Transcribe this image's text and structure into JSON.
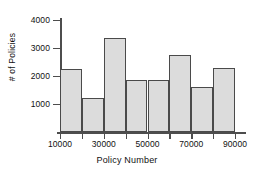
{
  "chart_data": {
    "type": "bar",
    "title": "",
    "xlabel": "Policy Number",
    "ylabel": "# of Policies",
    "categories": [
      "10000-20000",
      "20000-30000",
      "30000-40000",
      "40000-50000",
      "50000-60000",
      "60000-70000",
      "70000-80000",
      "80000-90000"
    ],
    "bin_edges": [
      10000,
      20000,
      30000,
      40000,
      50000,
      60000,
      70000,
      80000,
      90000
    ],
    "values": [
      2250,
      1200,
      3350,
      1850,
      1870,
      2750,
      1600,
      2300
    ],
    "xlim": [
      10000,
      90000
    ],
    "ylim": [
      0,
      4000
    ],
    "xticks": [
      10000,
      20000,
      30000,
      40000,
      50000,
      60000,
      70000,
      80000,
      90000
    ],
    "xtick_labels": [
      "10000",
      "",
      "30000",
      "",
      "50000",
      "",
      "70000",
      "",
      "90000"
    ],
    "yticks": [
      1000,
      2000,
      3000,
      4000
    ],
    "ytick_labels": [
      "1000",
      "2000",
      "3000",
      "4000"
    ],
    "grid": false,
    "legend": null,
    "bar_fill_color": "#dcdcdc",
    "bar_edge_color": "#4a4a4a",
    "axis_color": "#4d4d4d",
    "text_color": "#111111"
  }
}
